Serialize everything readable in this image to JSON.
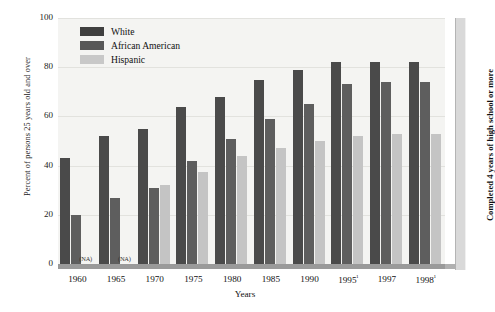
{
  "chart_data": {
    "type": "bar",
    "title": "",
    "xlabel": "Years",
    "ylabel": "Percent of persons 25 years old and over",
    "ylabel_right": "Completed 4 years of high school or more",
    "ylim": [
      0,
      100
    ],
    "yticks": [
      0,
      20,
      40,
      60,
      80,
      100
    ],
    "grid": true,
    "legend_position": "top-left",
    "categories": [
      "1960",
      "1965",
      "1970",
      "1975",
      "1980",
      "1985",
      "1990",
      "1995¹",
      "1997",
      "1998¹"
    ],
    "series": [
      {
        "name": "White",
        "color": "#4a4a4a",
        "values": [
          43,
          52,
          55,
          64,
          68,
          75,
          79,
          82,
          82,
          82
        ]
      },
      {
        "name": "African American",
        "color": "#5e5e5e",
        "values": [
          20,
          27,
          31,
          42,
          51,
          59,
          65,
          73,
          74,
          74
        ]
      },
      {
        "name": "Hispanic",
        "color": "#c4c4c4",
        "values": [
          null,
          null,
          32,
          37.5,
          44,
          47,
          50,
          52,
          53,
          53
        ]
      }
    ],
    "annotations": [
      {
        "text": "(NA)",
        "category": "1960",
        "series": "Hispanic"
      },
      {
        "text": "(NA)",
        "category": "1965",
        "series": "Hispanic"
      }
    ]
  },
  "legend": {
    "items": [
      {
        "label": "White",
        "swatch": "white"
      },
      {
        "label": "African American",
        "swatch": "african"
      },
      {
        "label": "Hispanic",
        "swatch": "hispanic"
      }
    ]
  }
}
